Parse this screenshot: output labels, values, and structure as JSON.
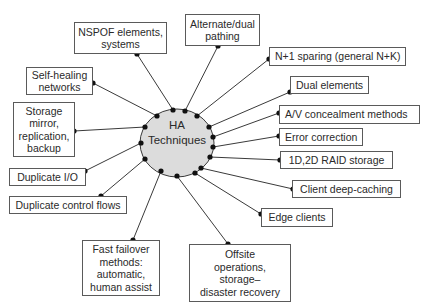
{
  "diagram": {
    "hub": {
      "label": "HA\nTechniques",
      "cx": 177,
      "cy": 143,
      "rx": 37,
      "ry": 34,
      "fill": "#dcdcdc",
      "stroke": "#3a3a3a"
    },
    "line_color": "#3a3a3a",
    "dot_color": "#111111",
    "nodes": [
      {
        "id": "nspof",
        "label": "NSPOF elements,\nsystems",
        "x": 74,
        "y": 22,
        "w": 93,
        "h": 32,
        "align": "center",
        "from": [
          173,
          110
        ],
        "to": [
          137,
          54
        ]
      },
      {
        "id": "alternate",
        "label": "Alternate/dual\npathing",
        "x": 185,
        "y": 14,
        "w": 75,
        "h": 32,
        "align": "center",
        "from": [
          185,
          111
        ],
        "to": [
          218,
          46
        ]
      },
      {
        "id": "n-plus-1",
        "label": "N+1 sparing (general N+K)",
        "x": 269,
        "y": 47,
        "w": 137,
        "h": 19,
        "align": "left",
        "from": [
          197,
          116
        ],
        "to": [
          269,
          59
        ]
      },
      {
        "id": "self-healing",
        "label": "Self-healing\nnetworks",
        "x": 26,
        "y": 67,
        "w": 67,
        "h": 28,
        "align": "center",
        "from": [
          157,
          116
        ],
        "to": [
          93,
          83
        ]
      },
      {
        "id": "dual-elements",
        "label": "Dual elements",
        "x": 290,
        "y": 76,
        "w": 79,
        "h": 18,
        "align": "left",
        "from": [
          209,
          127
        ],
        "to": [
          290,
          92
        ]
      },
      {
        "id": "storage",
        "label": "Storage\nmirror,\nreplication,\nbackup",
        "x": 13,
        "y": 102,
        "w": 62,
        "h": 55,
        "align": "center",
        "from": [
          145,
          127
        ],
        "to": [
          74,
          131
        ]
      },
      {
        "id": "av-concealment",
        "label": "A/V concealment methods",
        "x": 279,
        "y": 105,
        "w": 141,
        "h": 19,
        "align": "left",
        "from": [
          213,
          137
        ],
        "to": [
          279,
          113
        ]
      },
      {
        "id": "error-correction",
        "label": "Error correction",
        "x": 279,
        "y": 128,
        "w": 84,
        "h": 18,
        "align": "left",
        "from": [
          213,
          147
        ],
        "to": [
          279,
          136
        ]
      },
      {
        "id": "duplicate-io",
        "label": "Duplicate I/O",
        "x": 9,
        "y": 168,
        "w": 77,
        "h": 18,
        "align": "center",
        "from": [
          141,
          143
        ],
        "to": [
          85,
          171
        ]
      },
      {
        "id": "raid",
        "label": "1D,2D RAID storage",
        "x": 280,
        "y": 151,
        "w": 113,
        "h": 18,
        "align": "center",
        "from": [
          210,
          157
        ],
        "to": [
          280,
          160
        ]
      },
      {
        "id": "duplicate-control",
        "label": "Duplicate control flows",
        "x": 9,
        "y": 196,
        "w": 118,
        "h": 18,
        "align": "center",
        "from": [
          145,
          159
        ],
        "to": [
          101,
          196
        ]
      },
      {
        "id": "client-caching",
        "label": "Client deep-caching",
        "x": 292,
        "y": 180,
        "w": 109,
        "h": 18,
        "align": "center",
        "from": [
          201,
          168
        ],
        "to": [
          293,
          189
        ]
      },
      {
        "id": "edge-clients",
        "label": "Edge clients",
        "x": 261,
        "y": 208,
        "w": 72,
        "h": 19,
        "align": "center",
        "from": [
          195,
          173
        ],
        "to": [
          261,
          214
        ]
      },
      {
        "id": "fast-failover",
        "label": "Fast failover\nmethods:\nautomatic,\nhuman assist",
        "x": 82,
        "y": 240,
        "w": 78,
        "h": 56,
        "align": "center",
        "from": [
          161,
          171
        ],
        "to": [
          133,
          240
        ]
      },
      {
        "id": "offsite",
        "label": "Offsite\noperations,\nstorage–\ndisaster recovery",
        "x": 189,
        "y": 244,
        "w": 102,
        "h": 58,
        "align": "center",
        "from": [
          177,
          176
        ],
        "to": [
          228,
          244
        ]
      }
    ]
  }
}
